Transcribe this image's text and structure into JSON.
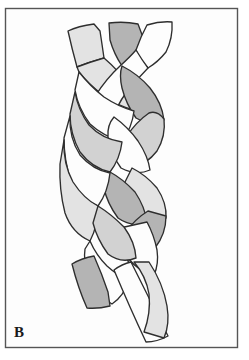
{
  "figure": {
    "panel_label": "B",
    "caption_text": "B",
    "background_color": "#fdfdfd",
    "frame_color": "#4a4a4a",
    "outline_color": "#2e2e2e",
    "frame": {
      "x": 5,
      "y": 8,
      "width": 233,
      "height": 340
    }
  },
  "palette": {
    "strand_white": "#fdfdfd",
    "strand_light": "#e3e3e3",
    "strand_mid": "#d2d2d2",
    "strand_dark": "#b4b4b4",
    "outline": "#2e2e2e",
    "frame": "#555555",
    "page": "#ffffff"
  },
  "strands": [
    {
      "id": "strand-left",
      "name": "left-strand",
      "fill": "#e3e3e3",
      "start_label": "top-left tail",
      "end_label": "bottom-left tail"
    },
    {
      "id": "strand-middle",
      "name": "middle-strand",
      "fill": "#b4b4b4",
      "start_label": "top-middle tail",
      "end_label": "bottom-middle tail"
    },
    {
      "id": "strand-right",
      "name": "right-strand",
      "fill": "#fdfdfd",
      "start_label": "top-right tail",
      "end_label": "bottom-right tail"
    }
  ],
  "geometry": {
    "top_tails": [
      {
        "name": "tail-top-left",
        "fill": "#e3e3e3",
        "d": "M 68 30 L 90 25 L 97 31 L 101 57 L 77 66 Z"
      },
      {
        "name": "tail-top-middle",
        "fill": "#b4b4b4",
        "d": "M 107 23 L 136 24 L 143 40 L 126 63 L 104 52 Z"
      },
      {
        "name": "tail-top-right",
        "fill": "#fdfdfd",
        "d": "M 146 24 L 170 21 L 167 44 L 153 58 L 136 51 L 142 34 Z"
      }
    ],
    "weave_segments": [
      {
        "name": "seg-left-01",
        "fill": "#e3e3e3",
        "d": "M 77 64 L 101 55 Q 116 66 126 80 Q 132 92 128 104 Q 114 100 100 92 Q 86 82 78 70 Z"
      },
      {
        "name": "seg-right-01",
        "fill": "#fdfdfd",
        "d": "M 153 56 Q 142 70 131 84 Q 122 96 119 108 Q 109 100 100 88 Q 110 72 125 60 L 136 51 Z"
      },
      {
        "name": "seg-mid-01",
        "fill": "#b4b4b4",
        "d": "M 127 62 Q 141 70 152 84 Q 162 98 163 114 Q 150 118 136 112 Q 126 100 124 86 Q 123 72 127 62 Z"
      },
      {
        "name": "seg-left-02",
        "fill": "#fdfdfd",
        "d": "M 80 70 Q 92 82 106 92 Q 118 100 128 104 Q 126 120 116 133 Q 100 128 88 116 Q 78 102 76 86 Z"
      },
      {
        "name": "seg-right-02",
        "fill": "#d2d2d2",
        "d": "M 163 112 Q 164 128 156 142 Q 146 155 132 160 Q 125 146 126 130 Q 134 116 146 108 Q 155 104 163 112 Z"
      },
      {
        "name": "seg-mid-02",
        "fill": "#fdfdfd",
        "d": "M 118 108 Q 130 118 139 132 Q 148 146 150 160 Q 136 166 122 160 Q 112 146 110 130 Q 110 118 118 108 Z"
      },
      {
        "name": "seg-left-03",
        "fill": "#d2d2d2",
        "d": "M 76 88 Q 80 104 90 118 Q 102 130 116 134 Q 114 150 104 162 Q 88 158 78 144 Q 70 128 70 110 Z"
      },
      {
        "name": "seg-right-03",
        "fill": "#e3e3e3",
        "d": "M 132 158 Q 144 164 154 176 Q 164 190 164 204 Q 150 208 136 200 Q 126 186 124 172 Z"
      },
      {
        "name": "seg-mid-03",
        "fill": "#b4b4b4",
        "d": "M 104 160 Q 116 166 128 178 Q 138 192 140 206 Q 126 212 112 204 Q 102 190 100 176 Z"
      },
      {
        "name": "seg-left-04",
        "fill": "#fdfdfd",
        "d": "M 70 112 Q 70 132 80 148 Q 92 162 106 164 Q 104 182 94 194 Q 78 188 70 172 Q 64 154 64 134 Z"
      },
      {
        "name": "seg-right-04",
        "fill": "#b4b4b4",
        "d": "M 164 202 Q 164 218 154 232 Q 144 244 130 248 Q 124 234 126 218 Q 134 206 146 198 Z"
      },
      {
        "name": "seg-mid-04",
        "fill": "#fdfdfd",
        "d": "M 140 204 Q 148 216 152 230 Q 154 244 150 256 Q 136 254 126 242 Q 118 228 118 214 Z"
      },
      {
        "name": "seg-left-05",
        "fill": "#e3e3e3",
        "d": "M 64 136 Q 64 158 74 176 Q 84 192 96 196 Q 96 216 88 230 Q 72 222 66 204 Q 60 182 60 158 Z"
      },
      {
        "name": "seg-mid-05",
        "fill": "#d2d2d2",
        "d": "M 96 196 Q 108 204 120 216 Q 130 230 132 246 Q 118 252 106 244 Q 96 230 92 214 Z"
      },
      {
        "name": "seg-left-06",
        "fill": "#fdfdfd",
        "d": "M 88 228 Q 94 242 104 252 Q 114 262 124 266 Q 120 282 108 290 Q 94 282 86 266 Q 80 248 82 236 Z"
      }
    ],
    "bottom_tails": [
      {
        "name": "tail-bottom-left",
        "fill": "#b4b4b4",
        "d": "M 72 262 L 92 256 L 106 282 L 108 302 L 86 306 L 72 286 Z"
      },
      {
        "name": "tail-bottom-middle",
        "fill": "#fdfdfd",
        "d": "M 112 268 L 128 262 L 160 318 L 166 334 L 146 340 L 126 306 Z"
      },
      {
        "name": "tail-bottom-right",
        "fill": "#e3e3e3",
        "d": "M 150 262 Q 164 282 166 304 Q 167 322 160 336 L 140 330 Q 148 312 146 294 Q 143 276 132 262 Z"
      }
    ]
  }
}
